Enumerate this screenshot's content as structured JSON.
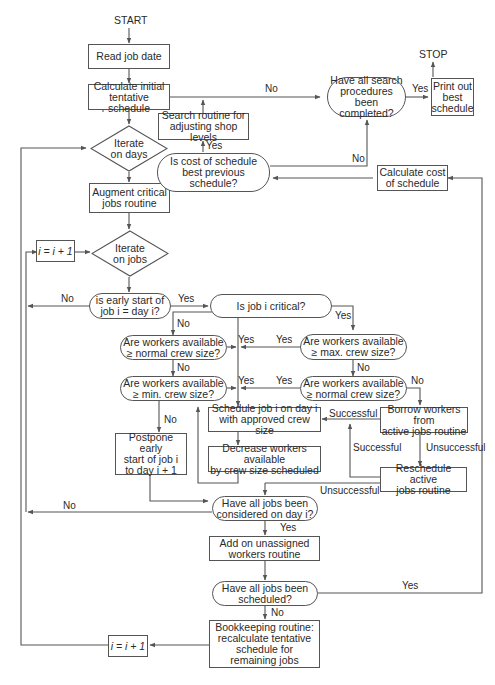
{
  "flowchart": {
    "terminals": {
      "start": "START",
      "stop": "STOP"
    },
    "nodes": {
      "read_job_date": "Read job date",
      "calc_initial": "Calculate initial\ntentative schedule",
      "iterate_days": "Iterate\non days",
      "augment_critical": "Augment critical\njobs routine",
      "i_increment_top": "i = i + 1",
      "iterate_jobs": "Iterate\non jobs",
      "early_start": "is early start of\njob i = day i?",
      "is_critical": "Is job i critical?",
      "avail_normal_left": "Are workers available\n≥ normal crew size?",
      "avail_min": "Are workers available\n≥ min. crew size?",
      "avail_max": "Are workers available\n≥ max. crew size?",
      "avail_normal_right": "Are workers available\n≥ normal crew size?",
      "postpone": "Postpone early\nstart of job i\nto day i + 1",
      "schedule_job": "Schedule job i on day i\nwith approved crew size",
      "decrease_workers": "Decrease workers available\nby crew size scheduled",
      "borrow_workers": "Borrow workers from\nactive jobs routine",
      "reschedule_active": "Reschedule active\njobs routine",
      "all_considered": "Have all jobs been\nconsidered on day i?",
      "add_unassigned": "Add on unassigned\nworkers routine",
      "all_scheduled": "Have all jobs been\nscheduled?",
      "bookkeeping": "Bookkeeping routine:\nrecalculate tentative\nschedule for\nremaining jobs",
      "i_increment_bottom": "i = i + 1",
      "search_routine": "Search routine for\nadjusting shop levels",
      "cost_best": "Is cost of schedule\nbest previous\nschedule?",
      "search_completed": "Have all search\nprocedures been\ncompleted?",
      "print_best": "Print out\nbest\nschedule",
      "calc_cost": "Calculate cost\nof schedule"
    },
    "edge_labels": {
      "search_no": "No",
      "search_yes": "Yes",
      "cost_yes": "Yes",
      "cost_no": "No",
      "early_no": "No",
      "early_yes": "Yes",
      "early_to_normal_no": "No",
      "critical_yes": "Yes",
      "normal_left_yes": "Yes",
      "normal_left_no": "No",
      "min_yes": "Yes",
      "min_no": "No",
      "max_yes": "Yes",
      "max_no": "No",
      "normal_right_yes": "Yes",
      "normal_right_no": "No",
      "borrow_successful": "Successful",
      "borrow_unsuccessful": "Unsuccessful",
      "reschedule_successful": "Successful",
      "reschedule_unsuccessful": "Unsuccessful",
      "considered_no": "No",
      "considered_yes": "Yes",
      "scheduled_yes": "Yes",
      "scheduled_no": "No"
    },
    "colors": {
      "line": "#555555",
      "text": "#2a2a2a",
      "background": "#ffffff"
    }
  },
  "caption": ""
}
